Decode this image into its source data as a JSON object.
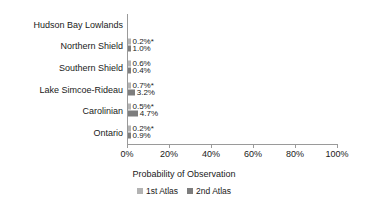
{
  "chart_data": {
    "type": "bar",
    "orientation": "horizontal",
    "title": "",
    "xlabel": "Probability of Observation",
    "ylabel": "",
    "xlim": [
      0,
      100
    ],
    "xticks": [
      0,
      20,
      40,
      60,
      80,
      100
    ],
    "xticklabels": [
      "0%",
      "20%",
      "40%",
      "60%",
      "80%",
      "100%"
    ],
    "grid": false,
    "legend_position": "bottom",
    "categories": [
      "Hudson Bay Lowlands",
      "Northern Shield",
      "Southern Shield",
      "Lake Simcoe-Rideau",
      "Carolinian",
      "Ontario"
    ],
    "series": [
      {
        "name": "1st Atlas",
        "color": "#b3b3b3",
        "values": [
          null,
          0.2,
          0.6,
          0.7,
          0.5,
          0.2
        ],
        "labels": [
          "",
          "0.2%*",
          "0.6%",
          "0.7%*",
          "0.5%*",
          "0.2%*"
        ]
      },
      {
        "name": "2nd Atlas",
        "color": "#7d7d7d",
        "values": [
          null,
          1.0,
          0.4,
          3.2,
          4.7,
          0.9
        ],
        "labels": [
          "",
          "1.0%",
          "0.4%",
          "3.2%",
          "4.7%",
          "0.9%"
        ]
      }
    ]
  },
  "axis": {
    "title": "Probability of Observation"
  },
  "legend": {
    "items": [
      {
        "label": "1st Atlas",
        "color": "#b3b3b3"
      },
      {
        "label": "2nd Atlas",
        "color": "#7d7d7d"
      }
    ]
  }
}
